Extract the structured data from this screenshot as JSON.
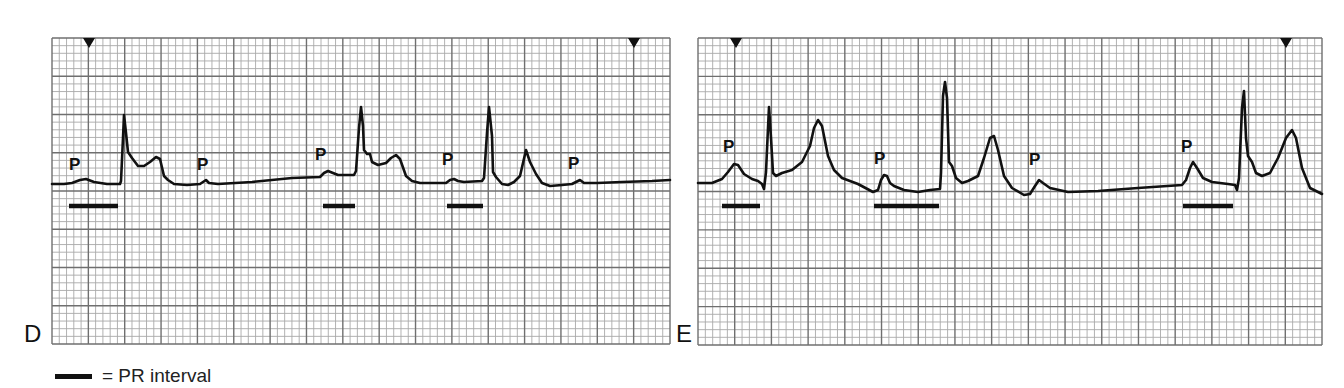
{
  "figure": {
    "grid": {
      "minor_color": "#a9a9a9",
      "major_color": "#6f6f6f",
      "trace_color": "#111111",
      "minor_per_major": 5
    },
    "panels": [
      {
        "id": "D",
        "letter": "D",
        "left": 52,
        "top": 38,
        "width": 618,
        "height": 306,
        "major_cols": 17,
        "major_rows": 8,
        "letter_pos": {
          "x": 24,
          "y": 322
        },
        "markers": [
          {
            "x": 37
          },
          {
            "x": 582
          }
        ],
        "trace": [
          [
            0,
            146
          ],
          [
            12,
            146
          ],
          [
            20,
            145
          ],
          [
            28,
            142
          ],
          [
            34,
            141
          ],
          [
            42,
            144
          ],
          [
            55,
            146
          ],
          [
            68,
            146
          ],
          [
            69,
            143
          ],
          [
            71,
            100
          ],
          [
            72,
            77
          ],
          [
            74,
            95
          ],
          [
            76,
            114
          ],
          [
            80,
            120
          ],
          [
            86,
            128
          ],
          [
            92,
            128
          ],
          [
            98,
            124
          ],
          [
            104,
            119
          ],
          [
            108,
            121
          ],
          [
            112,
            138
          ],
          [
            116,
            142
          ],
          [
            122,
            146
          ],
          [
            135,
            147
          ],
          [
            148,
            146
          ],
          [
            154,
            142
          ],
          [
            157,
            145
          ],
          [
            166,
            146
          ],
          [
            200,
            144
          ],
          [
            240,
            140
          ],
          [
            268,
            139
          ],
          [
            272,
            135
          ],
          [
            276,
            133
          ],
          [
            281,
            135
          ],
          [
            286,
            137
          ],
          [
            302,
            137
          ],
          [
            304,
            133
          ],
          [
            307,
            90
          ],
          [
            309,
            69
          ],
          [
            311,
            88
          ],
          [
            312,
            112
          ],
          [
            315,
            116
          ],
          [
            318,
            116
          ],
          [
            320,
            124
          ],
          [
            326,
            127
          ],
          [
            334,
            125
          ],
          [
            339,
            120
          ],
          [
            344,
            117
          ],
          [
            348,
            121
          ],
          [
            354,
            138
          ],
          [
            360,
            143
          ],
          [
            368,
            145
          ],
          [
            394,
            145
          ],
          [
            398,
            142
          ],
          [
            402,
            141
          ],
          [
            406,
            143
          ],
          [
            412,
            144
          ],
          [
            430,
            143
          ],
          [
            432,
            140
          ],
          [
            435,
            95
          ],
          [
            437,
            69
          ],
          [
            440,
            98
          ],
          [
            441,
            134
          ],
          [
            444,
            139
          ],
          [
            450,
            146
          ],
          [
            456,
            147
          ],
          [
            462,
            144
          ],
          [
            468,
            138
          ],
          [
            474,
            112
          ],
          [
            478,
            124
          ],
          [
            484,
            136
          ],
          [
            490,
            145
          ],
          [
            498,
            148
          ],
          [
            510,
            147
          ],
          [
            520,
            146
          ],
          [
            524,
            144
          ],
          [
            528,
            142
          ],
          [
            532,
            145
          ],
          [
            545,
            145
          ],
          [
            570,
            144
          ],
          [
            600,
            143
          ],
          [
            618,
            142
          ]
        ],
        "p_labels": [
          {
            "text": "P",
            "x": 17,
            "y": 118
          },
          {
            "text": "P",
            "x": 145,
            "y": 118
          },
          {
            "text": "P",
            "x": 263,
            "y": 108
          },
          {
            "text": "P",
            "x": 390,
            "y": 113
          },
          {
            "text": "P",
            "x": 516,
            "y": 117
          }
        ],
        "pr_bars": [
          {
            "x1": 17,
            "x2": 66,
            "y": 168
          },
          {
            "x1": 271,
            "x2": 303,
            "y": 168
          },
          {
            "x1": 395,
            "x2": 431,
            "y": 168
          }
        ]
      },
      {
        "id": "E",
        "letter": "E",
        "left": 698,
        "top": 38,
        "width": 624,
        "height": 307,
        "major_cols": 17,
        "major_rows": 8,
        "letter_pos": {
          "x": -22,
          "y": 322
        },
        "markers": [
          {
            "x": 38
          },
          {
            "x": 588
          }
        ],
        "trace": [
          [
            0,
            145
          ],
          [
            14,
            145
          ],
          [
            24,
            141
          ],
          [
            30,
            134
          ],
          [
            36,
            126
          ],
          [
            40,
            127
          ],
          [
            46,
            136
          ],
          [
            54,
            141
          ],
          [
            60,
            143
          ],
          [
            64,
            146
          ],
          [
            66,
            151
          ],
          [
            68,
            134
          ],
          [
            70,
            90
          ],
          [
            71,
            69
          ],
          [
            73,
            100
          ],
          [
            75,
            135
          ],
          [
            78,
            138
          ],
          [
            84,
            135
          ],
          [
            94,
            132
          ],
          [
            104,
            124
          ],
          [
            112,
            108
          ],
          [
            116,
            90
          ],
          [
            120,
            82
          ],
          [
            124,
            88
          ],
          [
            130,
            118
          ],
          [
            136,
            132
          ],
          [
            144,
            140
          ],
          [
            160,
            146
          ],
          [
            175,
            154
          ],
          [
            180,
            152
          ],
          [
            183,
            142
          ],
          [
            186,
            137
          ],
          [
            189,
            138
          ],
          [
            192,
            145
          ],
          [
            196,
            148
          ],
          [
            206,
            152
          ],
          [
            220,
            154
          ],
          [
            232,
            152
          ],
          [
            242,
            151
          ],
          [
            243,
            135
          ],
          [
            245,
            58
          ],
          [
            247,
            44
          ],
          [
            249,
            60
          ],
          [
            251,
            124
          ],
          [
            254,
            128
          ],
          [
            258,
            140
          ],
          [
            264,
            145
          ],
          [
            270,
            143
          ],
          [
            280,
            138
          ],
          [
            286,
            120
          ],
          [
            292,
            100
          ],
          [
            296,
            98
          ],
          [
            300,
            112
          ],
          [
            306,
            138
          ],
          [
            314,
            150
          ],
          [
            326,
            157
          ],
          [
            332,
            156
          ],
          [
            337,
            148
          ],
          [
            341,
            142
          ],
          [
            345,
            145
          ],
          [
            352,
            150
          ],
          [
            370,
            154
          ],
          [
            400,
            153
          ],
          [
            440,
            150
          ],
          [
            484,
            147
          ],
          [
            488,
            142
          ],
          [
            492,
            130
          ],
          [
            495,
            124
          ],
          [
            499,
            130
          ],
          [
            505,
            140
          ],
          [
            514,
            144
          ],
          [
            530,
            146
          ],
          [
            537,
            147
          ],
          [
            539,
            152
          ],
          [
            541,
            140
          ],
          [
            544,
            70
          ],
          [
            546,
            53
          ],
          [
            548,
            100
          ],
          [
            550,
            118
          ],
          [
            554,
            124
          ],
          [
            558,
            135
          ],
          [
            564,
            138
          ],
          [
            572,
            135
          ],
          [
            580,
            120
          ],
          [
            588,
            100
          ],
          [
            594,
            92
          ],
          [
            598,
            100
          ],
          [
            604,
            130
          ],
          [
            612,
            150
          ],
          [
            624,
            156
          ]
        ],
        "p_labels": [
          {
            "text": "P",
            "x": 25,
            "y": 100
          },
          {
            "text": "P",
            "x": 176,
            "y": 112
          },
          {
            "text": "P",
            "x": 331,
            "y": 113
          },
          {
            "text": "P",
            "x": 483,
            "y": 100
          }
        ],
        "pr_bars": [
          {
            "x1": 24,
            "x2": 62,
            "y": 168
          },
          {
            "x1": 176,
            "x2": 241,
            "y": 168
          },
          {
            "x1": 485,
            "x2": 535,
            "y": 168
          }
        ]
      }
    ],
    "legend": {
      "symbol": "pr-interval-bar",
      "text": "= PR interval"
    }
  }
}
